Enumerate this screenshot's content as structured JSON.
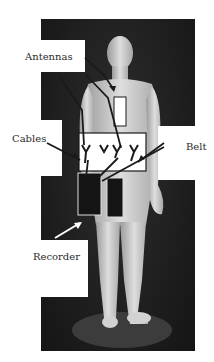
{
  "figure": {
    "labels": {
      "antennas": "Antennas",
      "cables": "Cables",
      "belt": "Belt",
      "recorder": "Recorder"
    },
    "colors": {
      "background": "#ffffff",
      "photo_background": "#1c1c1c",
      "figure_skin": "#cfcfcf",
      "arrow": "#1a1a1a",
      "recorder_box": "#141414",
      "label_text": "#2a2a2a"
    }
  }
}
